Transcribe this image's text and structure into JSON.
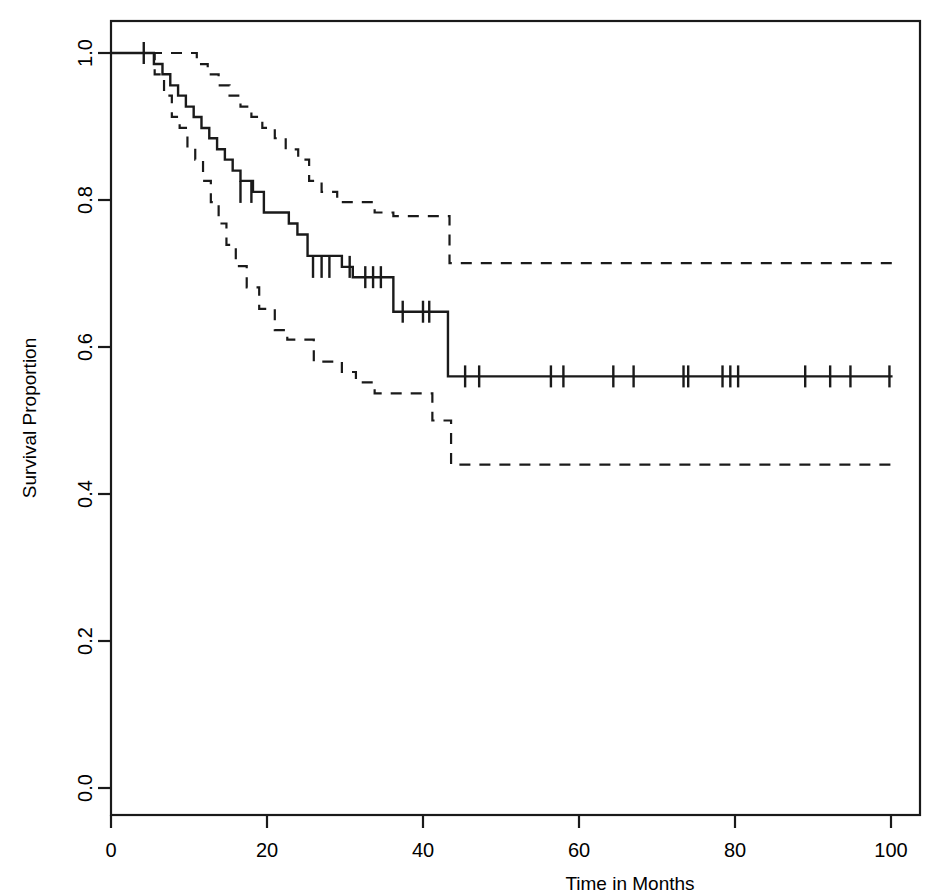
{
  "chart_data": {
    "type": "line",
    "title": "",
    "subtitle": "",
    "xlabel": "Time in Months",
    "ylabel": "Survival Proportion",
    "xlim": [
      0,
      105
    ],
    "ylim": [
      0.0,
      1.0
    ],
    "xticks": [
      0,
      20,
      40,
      60,
      80,
      100
    ],
    "xtick_labels": [
      "0",
      "20",
      "40",
      "60",
      "80",
      "100"
    ],
    "yticks": [
      0.0,
      0.2,
      0.4,
      0.6,
      0.8,
      1.0
    ],
    "ytick_labels": [
      "0.0",
      "0.2",
      "0.4",
      "0.6",
      "0.8",
      "1.0"
    ],
    "grid": false,
    "legend": "none",
    "frame": "box",
    "line_color": "#1a1a1a",
    "series": [
      {
        "name": "Kaplan-Meier survival estimate",
        "style": "solid",
        "step": "post",
        "x": [
          0,
          4.2,
          5.5,
          6.6,
          7.6,
          8.6,
          9.6,
          10.6,
          11.6,
          12.6,
          13.6,
          14.6,
          15.6,
          16.6,
          18.2,
          19.6,
          21.6,
          22.8,
          23.9,
          25.2,
          29.6,
          31.0,
          33.8,
          36.2,
          41.0,
          43.2,
          100.2
        ],
        "y": [
          1.0,
          1.0,
          0.985,
          0.971,
          0.956,
          0.942,
          0.927,
          0.913,
          0.898,
          0.884,
          0.869,
          0.855,
          0.84,
          0.826,
          0.811,
          0.783,
          0.783,
          0.768,
          0.753,
          0.724,
          0.709,
          0.695,
          0.695,
          0.648,
          0.648,
          0.56,
          0.56
        ]
      },
      {
        "name": "Upper 95% confidence limit",
        "style": "dashed",
        "step": "post",
        "x": [
          0,
          4.2,
          9.4,
          11.0,
          12.4,
          13.8,
          15.2,
          16.6,
          18.0,
          19.4,
          21.0,
          22.4,
          24.0,
          25.4,
          27.0,
          29.0,
          31.0,
          33.8,
          36.2,
          41.0,
          43.4,
          100.2
        ],
        "y": [
          1.0,
          1.0,
          1.0,
          0.985,
          0.971,
          0.956,
          0.942,
          0.927,
          0.913,
          0.898,
          0.884,
          0.869,
          0.855,
          0.826,
          0.811,
          0.797,
          0.797,
          0.783,
          0.778,
          0.778,
          0.714,
          0.714
        ]
      },
      {
        "name": "Lower 95% confidence limit",
        "style": "dashed",
        "step": "post",
        "x": [
          0,
          4.2,
          5.6,
          6.8,
          7.8,
          8.8,
          9.8,
          10.8,
          11.8,
          12.8,
          13.8,
          14.8,
          16.0,
          17.4,
          19.0,
          21.0,
          22.6,
          24.2,
          26.0,
          29.6,
          31.4,
          33.8,
          36.4,
          41.2,
          43.6,
          100.2
        ],
        "y": [
          1.0,
          1.0,
          0.971,
          0.942,
          0.913,
          0.898,
          0.87,
          0.855,
          0.826,
          0.797,
          0.768,
          0.739,
          0.71,
          0.681,
          0.652,
          0.623,
          0.61,
          0.61,
          0.58,
          0.566,
          0.552,
          0.537,
          0.537,
          0.5,
          0.44,
          0.44
        ]
      }
    ],
    "censor_marks": {
      "description": "censoring tick marks on the Kaplan-Meier curve",
      "points": [
        {
          "x": 4.2,
          "y": 1.0
        },
        {
          "x": 16.6,
          "y": 0.811
        },
        {
          "x": 18.0,
          "y": 0.811
        },
        {
          "x": 25.9,
          "y": 0.709
        },
        {
          "x": 27.0,
          "y": 0.709
        },
        {
          "x": 28.0,
          "y": 0.709
        },
        {
          "x": 30.6,
          "y": 0.709
        },
        {
          "x": 32.6,
          "y": 0.695
        },
        {
          "x": 33.6,
          "y": 0.695
        },
        {
          "x": 34.6,
          "y": 0.695
        },
        {
          "x": 37.4,
          "y": 0.648
        },
        {
          "x": 40.0,
          "y": 0.648
        },
        {
          "x": 40.8,
          "y": 0.648
        },
        {
          "x": 45.4,
          "y": 0.56
        },
        {
          "x": 47.2,
          "y": 0.56
        },
        {
          "x": 56.4,
          "y": 0.56
        },
        {
          "x": 58.0,
          "y": 0.56
        },
        {
          "x": 64.4,
          "y": 0.56
        },
        {
          "x": 67.0,
          "y": 0.56
        },
        {
          "x": 73.4,
          "y": 0.56
        },
        {
          "x": 74.0,
          "y": 0.56
        },
        {
          "x": 78.4,
          "y": 0.56
        },
        {
          "x": 79.4,
          "y": 0.56
        },
        {
          "x": 80.4,
          "y": 0.56
        },
        {
          "x": 89.0,
          "y": 0.56
        },
        {
          "x": 92.2,
          "y": 0.56
        },
        {
          "x": 94.8,
          "y": 0.56
        },
        {
          "x": 99.8,
          "y": 0.56
        }
      ]
    }
  },
  "axes": {
    "x_title": "Time in Months",
    "y_title": "Survival Proportion",
    "x_tick_labels": [
      "0",
      "20",
      "40",
      "60",
      "80",
      "100"
    ],
    "y_tick_labels": [
      "0.0",
      "0.2",
      "0.4",
      "0.6",
      "0.8",
      "1.0"
    ]
  }
}
